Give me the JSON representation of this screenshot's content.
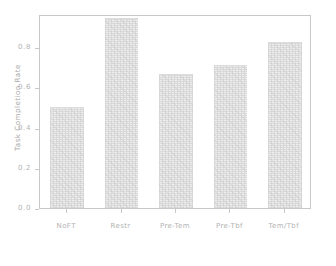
{
  "chart_data": {
    "type": "bar",
    "title": "",
    "xlabel": "",
    "ylabel": "Task Completion Rate",
    "categories": [
      "NoFT",
      "Restr",
      "Pre-Tem",
      "Pre-Tbf",
      "Tem/Tbf"
    ],
    "values": [
      0.5,
      0.945,
      0.665,
      0.71,
      0.825
    ],
    "ylim": [
      0.0,
      0.965
    ],
    "yticks": [
      "0.0",
      "0.2",
      "0.4",
      "0.6",
      "0.8"
    ],
    "ytick_values": [
      0.0,
      0.2,
      0.4,
      0.6,
      0.8
    ],
    "grid": false,
    "legend": "none",
    "bar_color": "#eeeeee",
    "axis_color": "#c8c8c8",
    "text_color": "#b3b3b3"
  }
}
